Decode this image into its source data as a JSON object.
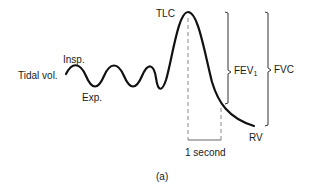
{
  "diagram": {
    "labels": {
      "tidal_volume": "Tidal vol.",
      "inspiration": "Insp.",
      "expiration": "Exp.",
      "tlc": "TLC",
      "fev": "FEV",
      "fev_subscript": "1",
      "fvc": "FVC",
      "rv": "RV",
      "time_interval": "1 second",
      "panel": "(a)"
    },
    "colors": {
      "curve": "#111111",
      "dashed": "#888888",
      "bracket": "#333333",
      "text": "#1a1a1a"
    }
  }
}
